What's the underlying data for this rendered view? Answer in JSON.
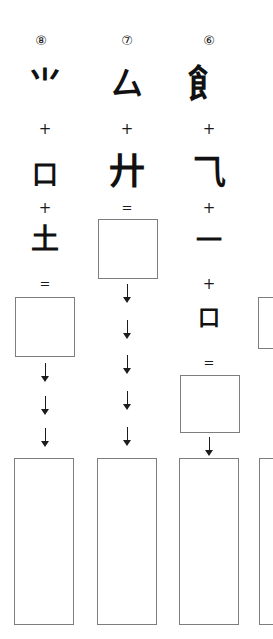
{
  "page": {
    "background_color": "#ffffff",
    "ink_color": "#111111",
    "box_border_color": "#7d7d7d",
    "width": 273,
    "height": 639
  },
  "columns": [
    {
      "index_label": "⑧",
      "index_number": 8,
      "index_x": 41,
      "components": [
        {
          "glyph": "⺌",
          "x": 45,
          "y": 84,
          "size": 34
        },
        {
          "glyph": "口",
          "x": 45,
          "y": 175,
          "size": 26
        },
        {
          "glyph": "土",
          "x": 45,
          "y": 240,
          "size": 28
        }
      ],
      "operators": [
        {
          "symbol": "+",
          "kind": "plus",
          "x": 45,
          "y": 130
        },
        {
          "symbol": "+",
          "kind": "plus",
          "x": 45,
          "y": 209
        },
        {
          "symbol": "=",
          "kind": "equals",
          "x": 45,
          "y": 285
        }
      ],
      "result_box": {
        "x": 15,
        "y": 297,
        "w": 60,
        "h": 60
      },
      "arrow_count_after_box": 3,
      "arrows_y": [
        363,
        396,
        428
      ],
      "arrow_x": 45,
      "final_box": {
        "x": 14,
        "y": 458,
        "w": 60,
        "h": 167
      }
    },
    {
      "index_label": "⑦",
      "index_number": 7,
      "index_x": 127,
      "components": [
        {
          "glyph": "厶",
          "x": 127,
          "y": 84,
          "size": 32
        },
        {
          "glyph": "廾",
          "x": 127,
          "y": 172,
          "size": 36
        }
      ],
      "operators": [
        {
          "symbol": "+",
          "kind": "plus",
          "x": 127,
          "y": 130
        },
        {
          "symbol": "=",
          "kind": "equals",
          "x": 127,
          "y": 209
        }
      ],
      "result_box": {
        "x": 98,
        "y": 219,
        "w": 60,
        "h": 60
      },
      "arrow_count_after_box": 5,
      "arrows_y": [
        284,
        320,
        355,
        391,
        427
      ],
      "arrow_x": 127,
      "final_box": {
        "x": 97,
        "y": 458,
        "w": 60,
        "h": 167
      }
    },
    {
      "index_label": "⑥",
      "index_number": 6,
      "index_x": 209,
      "components": [
        {
          "glyph": "飠",
          "x": 207,
          "y": 84,
          "size": 38
        },
        {
          "glyph": "⺄",
          "x": 209,
          "y": 172,
          "size": 34
        },
        {
          "glyph": "一",
          "x": 209,
          "y": 240,
          "size": 26
        },
        {
          "glyph": "口",
          "x": 209,
          "y": 318,
          "size": 22
        }
      ],
      "operators": [
        {
          "symbol": "+",
          "kind": "plus",
          "x": 209,
          "y": 130
        },
        {
          "symbol": "+",
          "kind": "plus",
          "x": 209,
          "y": 209
        },
        {
          "symbol": "+",
          "kind": "plus",
          "x": 209,
          "y": 285
        },
        {
          "symbol": "=",
          "kind": "equals",
          "x": 209,
          "y": 364
        }
      ],
      "result_box": {
        "x": 180,
        "y": 375,
        "w": 60,
        "h": 58
      },
      "arrow_count_after_box": 1,
      "arrows_y": [
        437
      ],
      "arrow_x": 209,
      "final_box": {
        "x": 179,
        "y": 458,
        "w": 60,
        "h": 167
      }
    },
    {
      "index_label": "",
      "index_number": null,
      "index_x": null,
      "components": [],
      "operators": [],
      "result_box": {
        "x": 258,
        "y": 297,
        "w": 60,
        "h": 52
      },
      "arrow_count_after_box": 0,
      "arrows_y": [],
      "arrow_x": null,
      "final_box": {
        "x": 259,
        "y": 458,
        "w": 60,
        "h": 167
      }
    }
  ]
}
